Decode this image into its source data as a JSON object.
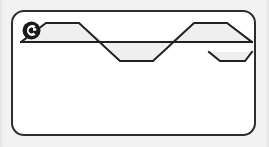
{
  "page": {
    "background_color": "#f2f2f2",
    "width": 269,
    "height": 147
  },
  "card": {
    "name": "waveform-card",
    "background_color": "#ffffff",
    "border_color": "#2e2e2e",
    "border_width": 2,
    "corner_radius": 13
  },
  "badge": {
    "label": "C",
    "icon": "circled-letter-c-icon",
    "fill_color": "#1a1a1a",
    "letter_color": "#ffffff"
  },
  "waveform": {
    "name": "trapezoidal-wave",
    "stroke_color": "#222222",
    "stroke_width": 2,
    "fill_color": "#efefef",
    "baseline_y": 30,
    "peak_y": 11,
    "trough_y": 49,
    "description": "trapezoidal alternating wave with two positive and two negative lobes",
    "points": "8,30 33,11 66,11 91,30 124,30 99,49 132,49 157,11 190,11 215,30 248,30 223,49 190,49 165,30 132,30 157,11 124,11 99,30 66,30 91,49 124,49",
    "path": "M 8 30 L 33 11 L 66 11 L 91 30 L 132 30 L 107 49 L 140 49 L 165 11 L 198 11 L 223 30 L 239 30 L 239 30 L 214 49 L 181 49 L 156 30 L 115 30 L 140 11 L 107 11 L 82 30 Z",
    "segments": [
      {
        "type": "rise",
        "from_x": 8,
        "to_x": 33,
        "from_y": 30,
        "to_y": 11
      },
      {
        "type": "peak-flat",
        "from_x": 33,
        "to_x": 66,
        "from_y": 11,
        "to_y": 11
      },
      {
        "type": "fall",
        "from_x": 66,
        "to_x": 107,
        "from_y": 11,
        "to_y": 49
      },
      {
        "type": "trough-flat",
        "from_x": 107,
        "to_x": 140,
        "from_y": 49,
        "to_y": 49
      },
      {
        "type": "rise",
        "from_x": 140,
        "to_x": 181,
        "from_y": 49,
        "to_y": 11
      },
      {
        "type": "peak-flat",
        "from_x": 181,
        "to_x": 214,
        "from_y": 11,
        "to_y": 11
      },
      {
        "type": "fall",
        "from_x": 214,
        "to_x": 239,
        "from_y": 11,
        "to_y": 30
      }
    ],
    "baseline": {
      "from_x": 8,
      "to_x": 239,
      "y": 30
    }
  }
}
